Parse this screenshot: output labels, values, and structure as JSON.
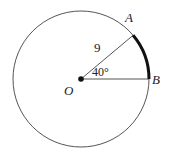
{
  "diagram": {
    "type": "circle-sector",
    "center_label": "O",
    "point_a_label": "A",
    "point_b_label": "B",
    "radius_label": "9",
    "angle_label": "40°",
    "radius_value": 9,
    "angle_degrees": 40,
    "colors": {
      "stroke": "#555555",
      "arc_highlight": "#111111",
      "background": "#ffffff"
    }
  }
}
